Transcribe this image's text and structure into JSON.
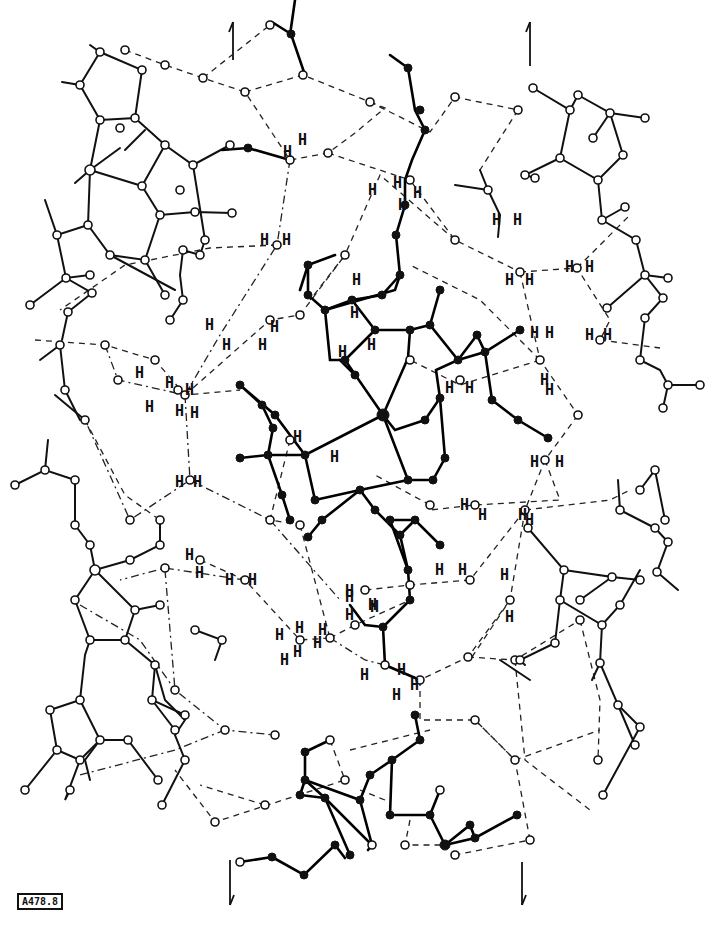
{
  "figure": {
    "type": "crystal-structure packing diagram",
    "label": "A478.8",
    "atom_label": "H",
    "arrows": [
      {
        "name": "up-arrow-left",
        "direction": "up",
        "x": 233,
        "y1": 60,
        "y2": 22
      },
      {
        "name": "up-arrow-right",
        "direction": "up",
        "x": 530,
        "y1": 66,
        "y2": 22
      },
      {
        "name": "down-arrow-left",
        "direction": "down",
        "x": 230,
        "y1": 860,
        "y2": 905
      },
      {
        "name": "down-arrow-right",
        "direction": "down",
        "x": 522,
        "y1": 862,
        "y2": 905
      }
    ],
    "legend": {
      "open_circle": "atom (neighbour molecules)",
      "filled_circle": "atom (reference molecule)",
      "solid_line": "covalent bond",
      "dashed_line": "hydrogen bond"
    },
    "colors": {
      "ink": "#111111",
      "paper": "#ffffff"
    }
  }
}
